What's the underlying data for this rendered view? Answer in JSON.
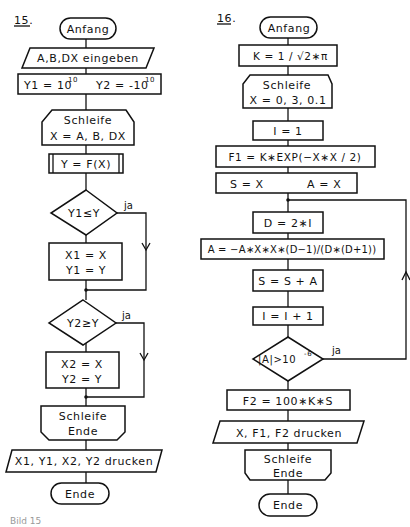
{
  "figure_caption": "Bild 15",
  "chart15": {
    "number": "15.",
    "start": "Anfang",
    "input": "A,B,DX eingeben",
    "init_y1": "Y1 = 10",
    "init_y1_exp": "10",
    "init_y2": "Y2 = -10",
    "init_y2_exp": "10",
    "loop_start_line1": "Schleife",
    "loop_start_line2": "X = A, B, DX",
    "function_call": "Y = F(X)",
    "decision1": "Y1≤Y",
    "decision1_yes": "ja",
    "assign1_line1": "X1 = X",
    "assign1_line2": "Y1 = Y",
    "decision2": "Y2≥Y",
    "decision2_yes": "ja",
    "assign2_line1": "X2 = X",
    "assign2_line2": "Y2 = Y",
    "loop_end_line1": "Schleife",
    "loop_end_line2": "Ende",
    "output": "X1, Y1, X2, Y2 drucken",
    "end": "Ende"
  },
  "chart16": {
    "number": "16.",
    "start": "Anfang",
    "const_k": "K = 1 / √2∗π",
    "loop_start_line1": "Schleife",
    "loop_start_line2": "X = 0, 3, 0.1",
    "init_i": "I = 1",
    "f1": "F1 = K∗EXP(−X∗X / 2)",
    "init_s": "S = X",
    "init_a": "A = X",
    "d_assign": "D = 2∗I",
    "a_assign": "A = −A∗X∗X∗(D−1)/(D∗(D+1))",
    "s_assign": "S = S + A",
    "i_increment": "I = I + 1",
    "decision": "|A|>10",
    "decision_exp": "-6",
    "decision_yes": "ja",
    "f2": "F2 = 100∗K∗S",
    "output": "X, F1, F2 drucken",
    "loop_end_line1": "Schleife",
    "loop_end_line2": "Ende",
    "end": "Ende"
  }
}
